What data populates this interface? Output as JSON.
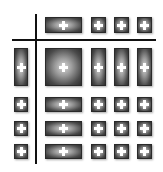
{
  "diagram": {
    "icon": "plus-icon",
    "colors": {
      "cell_dark": "#2e2e2e",
      "cell_light": "#d8d8d8",
      "plus": "#ffffff",
      "line": "#111111",
      "background": "#ffffff"
    },
    "columns": [
      {
        "x": 14,
        "w": 14
      },
      {
        "x": 45,
        "w": 37
      },
      {
        "x": 91,
        "w": 15
      },
      {
        "x": 114,
        "w": 15
      },
      {
        "x": 137,
        "w": 15
      }
    ],
    "rows": [
      {
        "y": 17,
        "h": 16
      },
      {
        "y": 48,
        "h": 38
      },
      {
        "y": 97,
        "h": 15
      },
      {
        "y": 121,
        "h": 15
      },
      {
        "y": 144,
        "h": 15
      }
    ]
  }
}
